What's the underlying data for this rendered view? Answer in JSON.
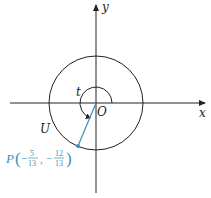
{
  "diagram": {
    "type": "unit-circle",
    "colors": {
      "axis": "#222222",
      "circle": "#222222",
      "point": "#3a8fb7"
    },
    "axes": {
      "x_label": "x",
      "y_label": "y",
      "origin_label": "O"
    },
    "circle": {
      "label": "U",
      "radius": 1
    },
    "angle": {
      "label": "t",
      "direction": "counterclockwise"
    },
    "point": {
      "name": "P",
      "x_num": "5",
      "x_den": "13",
      "x_sign": "−",
      "y_num": "12",
      "y_den": "13",
      "y_sign": "−",
      "coords": [
        -0.3846,
        -0.9231
      ]
    }
  }
}
